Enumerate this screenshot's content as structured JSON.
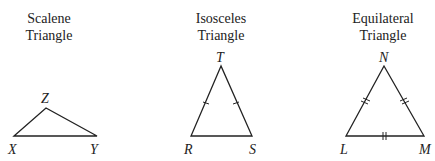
{
  "figures": [
    {
      "id": "scalene",
      "title_line1": "Scalene",
      "title_line2": "Triangle",
      "vertices": [
        {
          "label": "X",
          "x": 14,
          "y": 136
        },
        {
          "label": "Z",
          "x": 46,
          "y": 108
        },
        {
          "label": "Y",
          "x": 97,
          "y": 136
        }
      ],
      "tick_marks": "none"
    },
    {
      "id": "isosceles",
      "title_line1": "Isosceles",
      "title_line2": "Triangle",
      "vertices": [
        {
          "label": "T",
          "x": 221,
          "y": 66
        },
        {
          "label": "R",
          "x": 191,
          "y": 136
        },
        {
          "label": "S",
          "x": 252,
          "y": 136
        }
      ],
      "tick_marks": "single tick on sides RT and TS"
    },
    {
      "id": "equilateral",
      "title_line1": "Equilateral",
      "title_line2": "Triangle",
      "vertices": [
        {
          "label": "N",
          "x": 384,
          "y": 66
        },
        {
          "label": "L",
          "x": 346,
          "y": 136
        },
        {
          "label": "M",
          "x": 424,
          "y": 136
        }
      ],
      "tick_marks": "double tick on all three sides"
    }
  ],
  "colors": {
    "stroke": "#222222",
    "background": "#ffffff"
  }
}
